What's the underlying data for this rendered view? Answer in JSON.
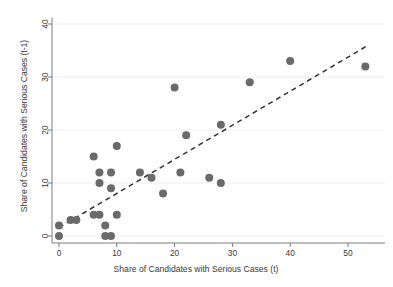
{
  "chart_data": {
    "type": "scatter",
    "title": "",
    "xlabel": "Share of Candidates with Serious Cases (t)",
    "ylabel": "Share of Candidates with Serious Cases (t-1)",
    "xlim": [
      -1.5,
      55
    ],
    "ylim": [
      -1.8,
      41.5
    ],
    "xticks": [
      0,
      10,
      20,
      30,
      40,
      50
    ],
    "xtick_labels": [
      "0",
      "10",
      "20",
      "30",
      "40",
      "50"
    ],
    "yticks": [
      0,
      10,
      20,
      30,
      40
    ],
    "ytick_labels": [
      "0",
      "10",
      "20",
      "30",
      "40"
    ],
    "grid": "horizontal",
    "legend": "none",
    "marker": {
      "shape": "circle",
      "color": "#6a6a6a",
      "size": 4
    },
    "series": [
      {
        "name": "Candidates with serious cases",
        "points": [
          [
            0,
            0
          ],
          [
            0,
            2
          ],
          [
            2,
            3
          ],
          [
            3,
            3
          ],
          [
            6,
            4
          ],
          [
            6,
            15
          ],
          [
            7,
            4
          ],
          [
            7,
            10
          ],
          [
            7,
            12
          ],
          [
            8,
            0
          ],
          [
            8,
            2
          ],
          [
            9,
            0
          ],
          [
            9,
            9
          ],
          [
            9,
            12
          ],
          [
            10,
            4
          ],
          [
            10,
            17
          ],
          [
            14,
            12
          ],
          [
            16,
            11
          ],
          [
            18,
            8
          ],
          [
            20,
            28
          ],
          [
            21,
            12
          ],
          [
            22,
            19
          ],
          [
            26,
            11
          ],
          [
            28,
            10
          ],
          [
            28,
            21
          ],
          [
            33,
            29
          ],
          [
            40,
            33
          ],
          [
            53,
            32
          ]
        ]
      }
    ],
    "fit_line": {
      "name": "linear-fit",
      "style": "dashed",
      "color": "#333333",
      "x_start": 0,
      "y_start": 1.6,
      "x_end": 53.5,
      "y_end": 36.0
    }
  },
  "figure": {
    "background_color": "#ffffff",
    "axis_color": "#6e6e6e",
    "grid_color": "#ececec",
    "text_color": "#3a3a3a"
  }
}
